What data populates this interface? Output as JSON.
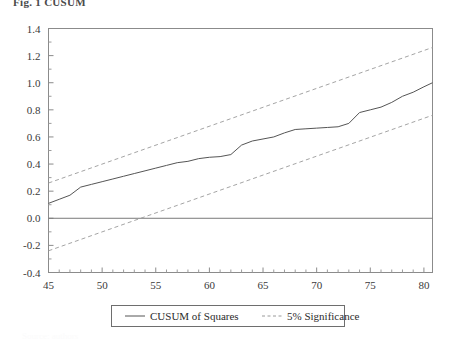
{
  "figure": {
    "caption": "Fig. 1  CUSUM",
    "bottom_note": "Source: authors"
  },
  "legend": {
    "position": "bottom-center",
    "entries": [
      {
        "label": "CUSUM of Squares",
        "style": "solid",
        "color": "#555555"
      },
      {
        "label": "5% Significance",
        "style": "dashed",
        "color": "#9a9a9a"
      }
    ]
  },
  "axes": {
    "y_ticks": [
      "1.4",
      "1.2",
      "1.0",
      "0.8",
      "0.6",
      "0.4",
      "0.2",
      "0.0",
      "-0.2",
      "-0.4"
    ],
    "x_ticks": [
      "45",
      "50",
      "55",
      "60",
      "65",
      "70",
      "75",
      "80"
    ]
  },
  "chart_data": {
    "type": "line",
    "title": "",
    "subtitle": "",
    "xlabel": "",
    "ylabel": "",
    "xlim": [
      45,
      80.8
    ],
    "ylim": [
      -0.4,
      1.4
    ],
    "xticks": [
      45,
      50,
      55,
      60,
      65,
      70,
      75,
      80
    ],
    "yticks": [
      -0.4,
      -0.2,
      0.0,
      0.2,
      0.4,
      0.6,
      0.8,
      1.0,
      1.2,
      1.4
    ],
    "grid": false,
    "zero_line": 0.0,
    "legend": "bottom-center",
    "series": [
      {
        "name": "CUSUM of Squares",
        "style": "solid",
        "color": "#555555",
        "x": [
          45,
          46,
          47,
          48,
          49,
          50,
          51,
          52,
          53,
          54,
          55,
          56,
          57,
          58,
          59,
          60,
          61,
          62,
          63,
          64,
          65,
          66,
          67,
          68,
          69,
          70,
          71,
          72,
          73,
          74,
          75,
          76,
          77,
          78,
          79,
          80,
          80.8
        ],
        "values": [
          0.11,
          0.14,
          0.17,
          0.23,
          0.25,
          0.27,
          0.29,
          0.31,
          0.33,
          0.35,
          0.37,
          0.39,
          0.41,
          0.42,
          0.44,
          0.45,
          0.455,
          0.47,
          0.54,
          0.57,
          0.585,
          0.6,
          0.63,
          0.655,
          0.66,
          0.665,
          0.67,
          0.675,
          0.7,
          0.78,
          0.8,
          0.82,
          0.855,
          0.9,
          0.93,
          0.97,
          1.0
        ]
      },
      {
        "name": "5% Significance (upper)",
        "style": "dashed",
        "color": "#9a9a9a",
        "x": [
          45,
          80.8
        ],
        "values": [
          0.26,
          1.26
        ]
      },
      {
        "name": "5% Significance (lower)",
        "style": "dashed",
        "color": "#9a9a9a",
        "x": [
          45,
          80.8
        ],
        "values": [
          -0.24,
          0.76
        ]
      }
    ]
  }
}
